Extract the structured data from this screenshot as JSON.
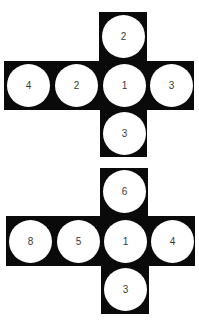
{
  "colors": {
    "face": "#0a0a0a",
    "circle": "#ffffff",
    "label": "#3a3a3a",
    "background": "#ffffff"
  },
  "nets": [
    {
      "name": "net-1",
      "faces": {
        "top": "2",
        "left_outer": "4",
        "left_inner": "2",
        "center": "1",
        "right": "3",
        "bottom": "3"
      }
    },
    {
      "name": "net-2",
      "faces": {
        "top": "6",
        "left_outer": "8",
        "left_inner": "5",
        "center": "1",
        "right": "4",
        "bottom": "3"
      }
    }
  ]
}
